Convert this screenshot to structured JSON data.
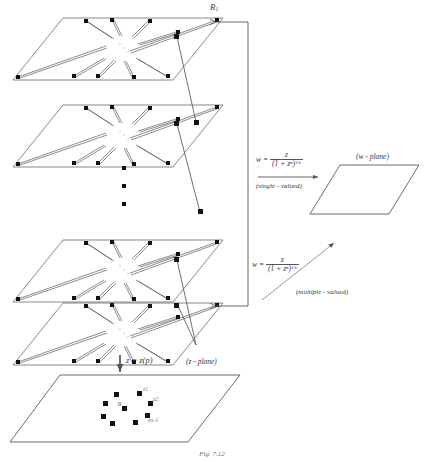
{
  "figure": {
    "caption": "Fig. 7.12",
    "branch_label": "R",
    "branch_label_sub": "1",
    "z_plane_label": "(z - plane)",
    "w_plane_label": "(w - plane)",
    "projection_label": "z = z(p)",
    "origin_label": "0",
    "point_labels": [
      "z1",
      "z2",
      "zn-1"
    ]
  },
  "maps": {
    "single": {
      "lhs": "w",
      "eq": "=",
      "numerator": "z",
      "denominator": "(1 + zⁿ)",
      "denominator_exp": "1/n",
      "note": "(single - valued)"
    },
    "multiple": {
      "lhs": "w",
      "eq": "=",
      "numerator": "z",
      "denominator": "(1 + zⁿ)",
      "denominator_exp": "1/n",
      "note": "(multiple - valued)"
    }
  },
  "sheets": [
    {
      "name": "sheet-1",
      "y": 18
    },
    {
      "name": "sheet-2",
      "y": 105
    },
    {
      "name": "sheet-3",
      "y": 240
    },
    {
      "name": "sheet-4",
      "y": 303
    }
  ],
  "ellipsis": {
    "count": 3
  },
  "colors": {
    "ink": "#2b2b2b",
    "line": "#555555",
    "point": "#111111",
    "faint": "#8a8a8a",
    "background": "#ffffff"
  }
}
